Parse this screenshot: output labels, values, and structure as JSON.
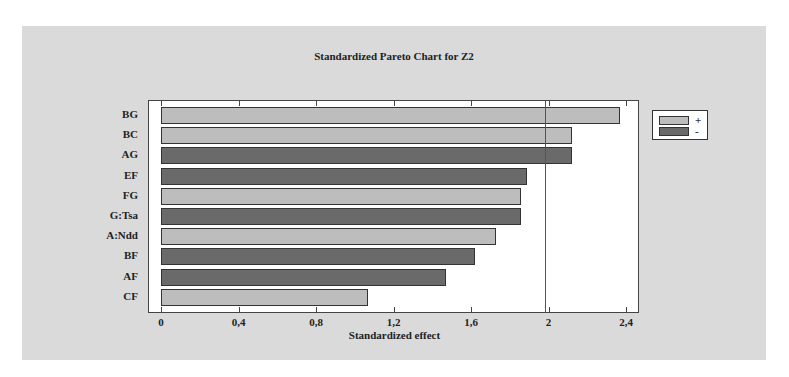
{
  "chart_data": {
    "type": "bar",
    "orientation": "horizontal",
    "title": "Standardized Pareto Chart for Z2",
    "xlabel": "Standardized effect",
    "ylabel": "",
    "xlim": [
      0,
      2.5
    ],
    "xticks": [
      "0",
      "0,4",
      "0,8",
      "1,2",
      "1,6",
      "2",
      "2,4"
    ],
    "xtick_values": [
      0,
      0.4,
      0.8,
      1.2,
      1.6,
      2.0,
      2.4
    ],
    "reference_line": 1.98,
    "categories": [
      "BG",
      "BC",
      "AG",
      "EF",
      "FG",
      "G:Tsa",
      "A:Ndd",
      "BF",
      "AF",
      "CF"
    ],
    "values": [
      2.37,
      2.12,
      2.12,
      1.89,
      1.86,
      1.86,
      1.73,
      1.62,
      1.47,
      1.07
    ],
    "signs": [
      "+",
      "+",
      "-",
      "-",
      "+",
      "-",
      "+",
      "-",
      "-",
      "+"
    ],
    "legend": [
      {
        "label": "+",
        "color": "#bdbdbd"
      },
      {
        "label": "-",
        "color": "#6a6a6a"
      }
    ],
    "legend_position": "right",
    "grid": false
  },
  "colors": {
    "positive": "#bdbdbd",
    "negative": "#6a6a6a",
    "panel": "#dadada"
  }
}
